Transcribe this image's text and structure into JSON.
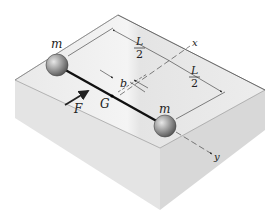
{
  "diagram": {
    "labels": {
      "mass_top": "m",
      "mass_bottom": "m",
      "force": "F",
      "center_of_mass": "G",
      "offset": "b",
      "half_length_1_num": "L",
      "half_length_1_den": "2",
      "half_length_2_num": "L",
      "half_length_2_den": "2",
      "x_axis": "x",
      "y_axis": "y"
    },
    "colors": {
      "block_top": "#ececec",
      "block_left": "#e2e2e2",
      "block_right": "#d4d4d4",
      "sphere": "#9a9a9a",
      "rod": "#111111",
      "dim_lines": "#333333"
    }
  }
}
